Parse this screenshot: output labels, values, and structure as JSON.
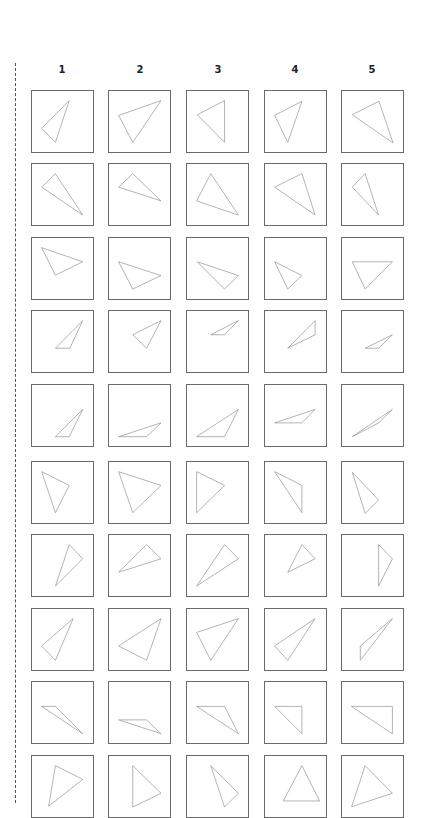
{
  "headers": [
    "1",
    "2",
    "3",
    "4",
    "5"
  ],
  "layout": {
    "col_left": [
      31,
      108,
      186,
      264,
      341
    ],
    "col_center": [
      62,
      140,
      218,
      295,
      372
    ],
    "row_top": [
      90,
      163,
      237,
      310,
      384,
      461,
      534,
      608,
      681,
      755
    ],
    "box_size": 63,
    "coord_scale": 190
  },
  "colors": {
    "box_border": "#6a6a6a",
    "triangle_stroke": "#8a8a8a",
    "dashed_line": "#555555",
    "header_text": "#222222"
  },
  "grid": [
    [
      [
        [
          116,
          30
        ],
        [
          30,
          116
        ],
        [
          73,
          160
        ]
      ],
      [
        [
          162,
          30
        ],
        [
          30,
          76
        ],
        [
          74,
          160
        ]
      ],
      [
        [
          117,
          30
        ],
        [
          32,
          74
        ],
        [
          117,
          160
        ]
      ],
      [
        [
          115,
          32
        ],
        [
          30,
          76
        ],
        [
          71,
          160
        ]
      ],
      [
        [
          115,
          32
        ],
        [
          32,
          74
        ],
        [
          159,
          162
        ]
      ]
    ],
    [
      [
        [
          73,
          30
        ],
        [
          30,
          72
        ],
        [
          158,
          159
        ]
      ],
      [
        [
          74,
          30
        ],
        [
          30,
          72
        ],
        [
          162,
          115
        ]
      ],
      [
        [
          74,
          30
        ],
        [
          30,
          115
        ],
        [
          160,
          159
        ]
      ],
      [
        [
          115,
          30
        ],
        [
          30,
          72
        ],
        [
          156,
          159
        ]
      ],
      [
        [
          72,
          30
        ],
        [
          32,
          72
        ],
        [
          114,
          159
        ]
      ]
    ],
    [
      [
        [
          30,
          30
        ],
        [
          158,
          74
        ],
        [
          73,
          116
        ]
      ],
      [
        [
          30,
          74
        ],
        [
          162,
          117
        ],
        [
          74,
          159
        ]
      ],
      [
        [
          32,
          74
        ],
        [
          160,
          117
        ],
        [
          117,
          159
        ]
      ],
      [
        [
          30,
          74
        ],
        [
          115,
          117
        ],
        [
          71,
          159
        ]
      ],
      [
        [
          32,
          74
        ],
        [
          157,
          74
        ],
        [
          72,
          159
        ]
      ]
    ],
    [
      [
        [
          158,
          30
        ],
        [
          73,
          116
        ],
        [
          118,
          116
        ]
      ],
      [
        [
          162,
          30
        ],
        [
          74,
          74
        ],
        [
          117,
          116
        ]
      ],
      [
        [
          160,
          30
        ],
        [
          74,
          74
        ],
        [
          117,
          74
        ]
      ],
      [
        [
          156,
          30
        ],
        [
          156,
          74
        ],
        [
          71,
          116
        ]
      ],
      [
        [
          157,
          74
        ],
        [
          72,
          116
        ],
        [
          114,
          116
        ]
      ]
    ],
    [
      [
        [
          158,
          76
        ],
        [
          73,
          161
        ],
        [
          116,
          161
        ]
      ],
      [
        [
          162,
          118
        ],
        [
          30,
          161
        ],
        [
          117,
          161
        ]
      ],
      [
        [
          160,
          76
        ],
        [
          30,
          161
        ],
        [
          117,
          161
        ]
      ],
      [
        [
          156,
          76
        ],
        [
          30,
          118
        ],
        [
          115,
          118
        ]
      ],
      [
        [
          157,
          76
        ],
        [
          32,
          161
        ],
        [
          114,
          118
        ]
      ]
    ],
    [
      [
        [
          30,
          30
        ],
        [
          116,
          73
        ],
        [
          73,
          158
        ]
      ],
      [
        [
          30,
          30
        ],
        [
          162,
          73
        ],
        [
          74,
          158
        ]
      ],
      [
        [
          30,
          30
        ],
        [
          117,
          73
        ],
        [
          30,
          158
        ]
      ],
      [
        [
          30,
          30
        ],
        [
          115,
          73
        ],
        [
          115,
          158
        ]
      ],
      [
        [
          32,
          32
        ],
        [
          114,
          118
        ],
        [
          72,
          160
        ]
      ]
    ],
    [
      [
        [
          116,
          30
        ],
        [
          158,
          74
        ],
        [
          73,
          159
        ]
      ],
      [
        [
          117,
          30
        ],
        [
          162,
          74
        ],
        [
          30,
          116
        ]
      ],
      [
        [
          117,
          30
        ],
        [
          160,
          74
        ],
        [
          30,
          159
        ]
      ],
      [
        [
          115,
          30
        ],
        [
          156,
          74
        ],
        [
          71,
          116
        ]
      ],
      [
        [
          114,
          30
        ],
        [
          157,
          74
        ],
        [
          114,
          159
        ]
      ]
    ],
    [
      [
        [
          128,
          30
        ],
        [
          30,
          115
        ],
        [
          73,
          160
        ]
      ],
      [
        [
          162,
          30
        ],
        [
          30,
          115
        ],
        [
          117,
          160
        ]
      ],
      [
        [
          160,
          30
        ],
        [
          30,
          73
        ],
        [
          74,
          160
        ]
      ],
      [
        [
          156,
          30
        ],
        [
          30,
          115
        ],
        [
          71,
          160
        ]
      ],
      [
        [
          157,
          30
        ],
        [
          57,
          115
        ],
        [
          57,
          160
        ]
      ]
    ],
    [
      [
        [
          30,
          76
        ],
        [
          73,
          76
        ],
        [
          158,
          161
        ]
      ],
      [
        [
          30,
          118
        ],
        [
          117,
          118
        ],
        [
          162,
          161
        ]
      ],
      [
        [
          30,
          76
        ],
        [
          117,
          76
        ],
        [
          160,
          161
        ]
      ],
      [
        [
          30,
          76
        ],
        [
          115,
          76
        ],
        [
          115,
          161
        ]
      ],
      [
        [
          29,
          76
        ],
        [
          157,
          76
        ],
        [
          157,
          161
        ]
      ]
    ],
    [
      [
        [
          73,
          30
        ],
        [
          158,
          73
        ],
        [
          52,
          156
        ]
      ],
      [
        [
          74,
          30
        ],
        [
          162,
          116
        ],
        [
          74,
          159
        ]
      ],
      [
        [
          74,
          30
        ],
        [
          160,
          116
        ],
        [
          117,
          159
        ]
      ],
      [
        [
          115,
          30
        ],
        [
          57,
          140
        ],
        [
          170,
          140
        ]
      ],
      [
        [
          72,
          30
        ],
        [
          157,
          116
        ],
        [
          30,
          158
        ]
      ]
    ]
  ]
}
